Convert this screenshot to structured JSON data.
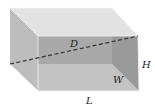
{
  "diagram": {
    "shape": "rectangular prism",
    "labels": {
      "diagonal": "D",
      "height": "H",
      "width": "W",
      "length": "L"
    },
    "colors": {
      "background": "#ffffff",
      "top_face": "#e2e2e2",
      "left_face": "#bdbdbd",
      "back_face_overlap": "#a9a9a9",
      "front_face_lower": "#c3c3c3",
      "right_face": "#9a9a9a",
      "edge": "#f4f4f4",
      "diagonal_line": "#333333",
      "label_text": "#222222"
    },
    "vertices": {
      "back_top_left": [
        10,
        8
      ],
      "back_top_right": [
        112,
        8
      ],
      "back_bottom_left": [
        10,
        64
      ],
      "back_bottom_right": [
        112,
        64
      ],
      "front_top_left": [
        38,
        36
      ],
      "front_top_right": [
        138,
        36
      ],
      "front_bottom_left": [
        38,
        91
      ],
      "front_bottom_right": [
        139,
        91
      ]
    },
    "diagonal": {
      "style": "dashed",
      "from": [
        10,
        64
      ],
      "to": [
        138,
        36
      ]
    }
  }
}
